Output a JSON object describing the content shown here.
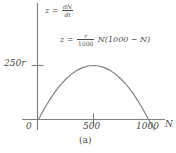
{
  "figure": {
    "caption": "(a)",
    "axis_label_x": "N",
    "background_color": "#ffffff",
    "ink_color": "#7f7f7f",
    "text_color": "#4a4a4a"
  },
  "equations": {
    "z_definition": {
      "lhs": "z",
      "equals": "=",
      "numerator": "dN",
      "denominator": "dt"
    },
    "z_expression": {
      "lhs": "z",
      "equals": "=",
      "numerator": "r",
      "denominator": "1000",
      "rest": "N(1000 − N)"
    }
  },
  "chart_data": {
    "type": "line",
    "title": "",
    "subtitle": "",
    "xlabel": "N",
    "ylabel": "z",
    "xlim": [
      0,
      1150
    ],
    "ylim": [
      0,
      300
    ],
    "grid": false,
    "legend": null,
    "annotations": [
      "z = dN/dt",
      "z = (r/1000) N(1000 − N)",
      "(a)"
    ],
    "x_ticks": [
      {
        "value": 0,
        "label": "0"
      },
      {
        "value": 500,
        "label": "500"
      },
      {
        "value": 1000,
        "label": "1000"
      }
    ],
    "y_ticks": [
      {
        "value": 250,
        "label": "250r"
      }
    ],
    "series": [
      {
        "name": "z = (r/1000) N(1000 - N)",
        "formula": "z = (r/1000) * N * (1000 - N)",
        "color": "#7f7f7f",
        "x": [
          0,
          50,
          100,
          150,
          200,
          250,
          300,
          350,
          400,
          450,
          500,
          550,
          600,
          650,
          700,
          750,
          800,
          850,
          900,
          950,
          1000
        ],
        "values": [
          0,
          47.5,
          90,
          127.5,
          160,
          187.5,
          210,
          227.5,
          240,
          247.5,
          250,
          247.5,
          240,
          227.5,
          210,
          187.5,
          160,
          127.5,
          90,
          47.5,
          0
        ]
      }
    ],
    "roots": [
      0,
      1000
    ],
    "vertex": {
      "x": 500,
      "y": 250
    }
  }
}
